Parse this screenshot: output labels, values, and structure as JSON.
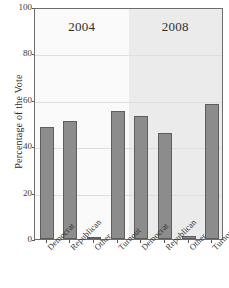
{
  "chart_data": {
    "type": "bar",
    "title": "",
    "xlabel": "",
    "ylabel": "Percentage of the Vote",
    "ylim": [
      0,
      100
    ],
    "yticks": [
      0,
      20,
      40,
      60,
      80,
      100
    ],
    "ytick_labels": [
      "0",
      "20",
      "40",
      "60",
      "80",
      "100"
    ],
    "grid": true,
    "legend": "none",
    "panels": [
      {
        "title": "2004",
        "categories": [
          "Democrat",
          "Republican",
          "Other",
          "Turnout"
        ],
        "values": [
          48.3,
          50.7,
          1.0,
          55.3
        ]
      },
      {
        "title": "2008",
        "categories": [
          "Democrat",
          "Republican",
          "Other",
          "Turnout"
        ],
        "values": [
          52.9,
          45.7,
          1.4,
          58.2
        ]
      }
    ],
    "colors": {
      "bar_fill": "#8c8c8c",
      "bar_edge": "#5e5e5e",
      "panel_left_bg": "#fafafa",
      "panel_right_bg": "#ebebeb",
      "axis": "#6d6d6d",
      "grid": "#dedede",
      "text": "#2b2b2b"
    }
  }
}
